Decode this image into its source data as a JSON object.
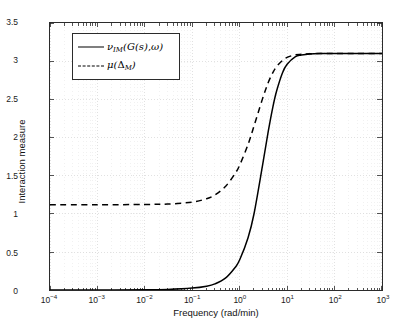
{
  "figure": {
    "background": "#ffffff",
    "frame_color": "#2b2b2b",
    "grid_color": "#d2d2d2"
  },
  "axis": {
    "xlabel": "Frequency (rad/min)",
    "ylabel": "Interaction measure",
    "x_tick_labels": [
      "10-4",
      "10-3",
      "10-2",
      "10-1",
      "100",
      "101",
      "102",
      "103"
    ],
    "x_tick_mantissa": "10",
    "x_tick_exponents": [
      "-4",
      "-3",
      "-2",
      "-1",
      "0",
      "1",
      "2",
      "3"
    ],
    "y_tick_labels": [
      "0",
      "0.5",
      "1",
      "1.5",
      "2",
      "2.5",
      "3",
      "3.5"
    ]
  },
  "legend": {
    "position": "upper-left",
    "boxed": true,
    "entries": [
      {
        "style": "solid",
        "color": "#000000",
        "symbol": "nu",
        "sub": "IM",
        "arg": "(G(s), ω)",
        "label": "ν_IM(G(s), ω)"
      },
      {
        "style": "dashed",
        "color": "#000000",
        "symbol": "mu",
        "sub": "M",
        "arg": "(Δ_M)",
        "label": "μ(Δ_M)"
      }
    ]
  },
  "chart_data": {
    "type": "line",
    "title": "",
    "xlabel": "Frequency (rad/min)",
    "ylabel": "Interaction measure",
    "xscale": "log",
    "yscale": "linear",
    "xlim": [
      0.0001,
      1000
    ],
    "ylim": [
      0,
      3.5
    ],
    "grid": true,
    "legend_position": "upper-left",
    "series": [
      {
        "name": "ν_IM(G(s), ω)",
        "style": "solid",
        "color": "#000000",
        "low_freq_asymptote": 0.0,
        "high_freq_asymptote": 3.1,
        "transition_center": 4.0,
        "x": [
          0.0001,
          0.001,
          0.01,
          0.03,
          0.1,
          0.2,
          0.3,
          0.5,
          0.8,
          1.0,
          1.5,
          2.0,
          3.0,
          4.0,
          5.0,
          6.0,
          8.0,
          10.0,
          15.0,
          20.0,
          30.0,
          50.0,
          100.0,
          300.0,
          1000.0
        ],
        "y": [
          0.004,
          0.005,
          0.007,
          0.012,
          0.03,
          0.055,
          0.085,
          0.16,
          0.3,
          0.4,
          0.69,
          1.0,
          1.62,
          2.08,
          2.4,
          2.61,
          2.85,
          2.96,
          3.06,
          3.08,
          3.095,
          3.1,
          3.1,
          3.1,
          3.1
        ]
      },
      {
        "name": "μ(Δ_M)",
        "style": "dashed",
        "color": "#000000",
        "low_freq_asymptote": 1.12,
        "high_freq_asymptote": 3.1,
        "transition_center": 1.2,
        "x": [
          0.0001,
          0.001,
          0.01,
          0.03,
          0.1,
          0.2,
          0.3,
          0.5,
          0.8,
          1.0,
          1.5,
          2.0,
          3.0,
          4.0,
          5.0,
          6.0,
          8.0,
          10.0,
          15.0,
          20.0,
          30.0,
          50.0,
          100.0,
          300.0,
          1000.0
        ],
        "y": [
          1.12,
          1.12,
          1.125,
          1.13,
          1.155,
          1.2,
          1.25,
          1.36,
          1.53,
          1.64,
          1.91,
          2.15,
          2.5,
          2.72,
          2.85,
          2.93,
          3.01,
          3.05,
          3.085,
          3.09,
          3.097,
          3.1,
          3.1,
          3.1,
          3.1
        ]
      }
    ]
  }
}
